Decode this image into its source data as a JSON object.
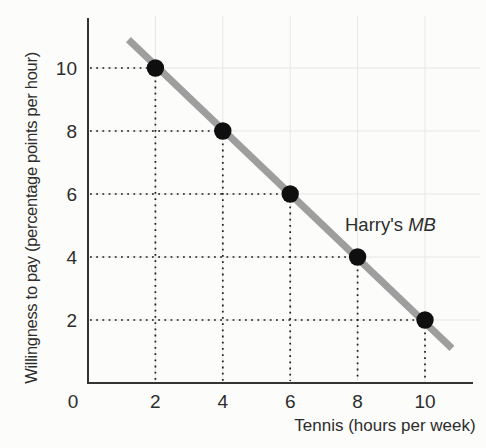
{
  "figure": {
    "annotation": {
      "prefix": "Harry's ",
      "italic": "MB"
    },
    "colors": {
      "background": "#fcfcfa",
      "axis": "#333333",
      "grid": "#e7e7e4",
      "guide": "#1c1c1c",
      "mb_line": "#9e9e9e",
      "point": "#0f0f0f",
      "text": "#2d2d2d"
    }
  },
  "chart_data": {
    "type": "line",
    "title": "",
    "xlabel": "Tennis (hours per week)",
    "ylabel": "Willingness to pay (percentage points per hour)",
    "x_ticks": [
      0,
      2,
      4,
      6,
      8,
      10
    ],
    "y_ticks": [
      2,
      4,
      6,
      8,
      10
    ],
    "xlim": [
      0,
      11.4
    ],
    "ylim": [
      0,
      11.6
    ],
    "grid": true,
    "legend_position": "none",
    "annotation_label": "Harry's MB",
    "guides": "dotted lines connect each data point to both axes",
    "series": [
      {
        "name": "Harry's MB",
        "points": [
          [
            2,
            10
          ],
          [
            4,
            8
          ],
          [
            6,
            6
          ],
          [
            8,
            4
          ],
          [
            10,
            2
          ]
        ],
        "line_from": [
          1.2,
          10.9
        ],
        "line_to": [
          10.8,
          1.1
        ]
      }
    ]
  }
}
